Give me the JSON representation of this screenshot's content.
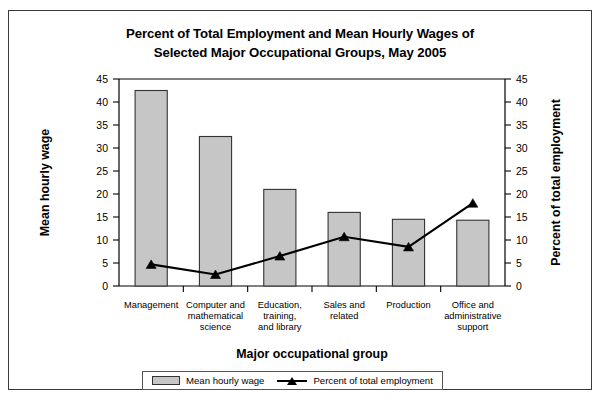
{
  "chart_data": {
    "type": "bar",
    "title": "Percent of Total Employment and Mean Hourly Wages of Selected Major Occupational Groups, May 2005",
    "title_line1": "Percent of Total Employment and Mean Hourly Wages of",
    "title_line2": "Selected Major Occupational Groups, May 2005",
    "xlabel": "Major occupational group",
    "ylabel": "Mean hourly wage",
    "y2label": "Percent of total employment",
    "ylim": [
      0,
      45
    ],
    "y2lim": [
      0,
      45
    ],
    "yticks": [
      0,
      5,
      10,
      15,
      20,
      25,
      30,
      35,
      40,
      45
    ],
    "y2ticks": [
      0,
      5,
      10,
      15,
      20,
      25,
      30,
      35,
      40,
      45
    ],
    "grid": false,
    "legend_position": "bottom",
    "categories": [
      "Management",
      "Computer and mathematical science",
      "Education, training, and library",
      "Sales and related",
      "Production",
      "Office and administrative support"
    ],
    "category_lines": [
      [
        "Management"
      ],
      [
        "Computer and",
        "mathematical",
        "science"
      ],
      [
        "Education,",
        "training,",
        "and library"
      ],
      [
        "Sales and",
        "related"
      ],
      [
        "Production"
      ],
      [
        "Office and",
        "administrative",
        "support"
      ]
    ],
    "series": [
      {
        "name": "Mean hourly wage",
        "type": "bar",
        "axis": "left",
        "color": "#c6c6c6",
        "values": [
          42.5,
          32.5,
          21.0,
          16.0,
          14.5,
          14.3
        ]
      },
      {
        "name": "Percent of total employment",
        "type": "line",
        "axis": "right",
        "color": "#000000",
        "marker": "triangle",
        "values": [
          4.7,
          2.5,
          6.5,
          10.7,
          8.5,
          18.0
        ]
      }
    ]
  },
  "legend": {
    "items": [
      {
        "label": "Mean hourly wage",
        "swatch": "bar"
      },
      {
        "label": "Percent of total employment",
        "swatch": "line-marker"
      }
    ]
  }
}
